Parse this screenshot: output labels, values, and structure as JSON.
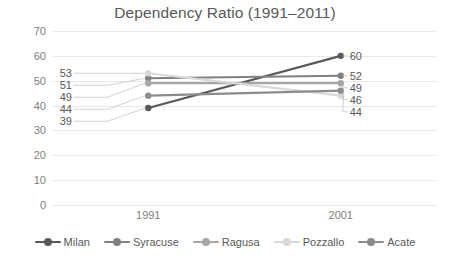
{
  "chart_data": {
    "type": "line",
    "title": "Dependency Ratio (1991–2011)",
    "xlabel": "",
    "ylabel": "",
    "categories": [
      "1991",
      "2001"
    ],
    "x": [
      "1991",
      "2001"
    ],
    "ylim": [
      0,
      70
    ],
    "yticks": [
      0,
      10,
      20,
      30,
      40,
      50,
      60,
      70
    ],
    "ytick_labels": [
      "0",
      "10",
      "20",
      "30",
      "40",
      "50",
      "60",
      "70"
    ],
    "grid": true,
    "legend_position": "bottom",
    "data_labels": true,
    "series": [
      {
        "name": "Milan",
        "values": [
          39,
          60
        ],
        "labels": [
          "39",
          "60"
        ],
        "color": "#595959"
      },
      {
        "name": "Syracuse",
        "values": [
          51,
          52
        ],
        "labels": [
          "51",
          "52"
        ],
        "color": "#808080"
      },
      {
        "name": "Ragusa",
        "values": [
          49,
          49
        ],
        "labels": [
          "49",
          "49"
        ],
        "color": "#a6a6a6"
      },
      {
        "name": "Pozzallo",
        "values": [
          53,
          44
        ],
        "labels": [
          "53",
          "44"
        ],
        "color": "#d9d9d9"
      },
      {
        "name": "Acate",
        "values": [
          44,
          46
        ],
        "labels": [
          "44",
          "46"
        ],
        "color": "#8c8c8c"
      }
    ]
  },
  "legend": {
    "items": [
      {
        "label": "Milan"
      },
      {
        "label": "Syracuse"
      },
      {
        "label": "Ragusa"
      },
      {
        "label": "Pozzallo"
      },
      {
        "label": "Acate"
      }
    ]
  },
  "colors": {
    "grid": "#e8e8e8",
    "axis_text": "#7f7f7f",
    "title_text": "#595959",
    "background": "#ffffff"
  }
}
